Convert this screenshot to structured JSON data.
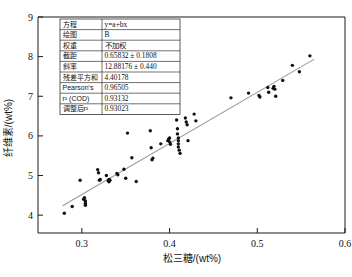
{
  "chart_data": {
    "type": "scatter",
    "title": "",
    "xlabel": "松三糖/(wt%)",
    "ylabel": "纤维素/(wt%)",
    "xlim": [
      0.25,
      0.6
    ],
    "ylim": [
      3.55,
      9.0
    ],
    "xticks": [
      "0.3",
      "0.4",
      "0.5",
      "0.6"
    ],
    "xtick_values": [
      0.3,
      0.4,
      0.5,
      0.6
    ],
    "yticks": [
      "4",
      "5",
      "6",
      "7",
      "8",
      "9"
    ],
    "ytick_values": [
      4,
      5,
      6,
      7,
      8,
      9
    ],
    "grid": false,
    "legend": "none",
    "series": [
      {
        "name": "B",
        "marker": "filled-circle",
        "color": "#111111",
        "points": [
          [
            0.28,
            4.05
          ],
          [
            0.289,
            4.22
          ],
          [
            0.298,
            4.88
          ],
          [
            0.302,
            4.4
          ],
          [
            0.303,
            4.44
          ],
          [
            0.304,
            4.3
          ],
          [
            0.304,
            4.36
          ],
          [
            0.304,
            4.25
          ],
          [
            0.318,
            5.15
          ],
          [
            0.319,
            5.07
          ],
          [
            0.32,
            4.88
          ],
          [
            0.321,
            4.9
          ],
          [
            0.328,
            5.0
          ],
          [
            0.33,
            4.87
          ],
          [
            0.331,
            4.9
          ],
          [
            0.331,
            4.84
          ],
          [
            0.332,
            4.88
          ],
          [
            0.34,
            5.05
          ],
          [
            0.341,
            5.02
          ],
          [
            0.348,
            5.16
          ],
          [
            0.35,
            4.93
          ],
          [
            0.352,
            6.07
          ],
          [
            0.357,
            5.45
          ],
          [
            0.362,
            4.85
          ],
          [
            0.378,
            6.13
          ],
          [
            0.379,
            5.7
          ],
          [
            0.38,
            5.4
          ],
          [
            0.381,
            5.44
          ],
          [
            0.39,
            5.8
          ],
          [
            0.398,
            5.88
          ],
          [
            0.399,
            5.92
          ],
          [
            0.4,
            5.85
          ],
          [
            0.4,
            5.95
          ],
          [
            0.401,
            5.79
          ],
          [
            0.408,
            6.4
          ],
          [
            0.409,
            6.18
          ],
          [
            0.409,
            6.05
          ],
          [
            0.41,
            5.95
          ],
          [
            0.41,
            5.88
          ],
          [
            0.41,
            5.8
          ],
          [
            0.41,
            5.72
          ],
          [
            0.411,
            5.64
          ],
          [
            0.412,
            5.56
          ],
          [
            0.418,
            6.45
          ],
          [
            0.419,
            6.35
          ],
          [
            0.42,
            6.28
          ],
          [
            0.421,
            5.88
          ],
          [
            0.428,
            6.55
          ],
          [
            0.43,
            6.38
          ],
          [
            0.47,
            6.96
          ],
          [
            0.49,
            7.08
          ],
          [
            0.502,
            7.02
          ],
          [
            0.503,
            6.98
          ],
          [
            0.512,
            7.22
          ],
          [
            0.513,
            7.1
          ],
          [
            0.518,
            7.2
          ],
          [
            0.519,
            7.25
          ],
          [
            0.52,
            7.18
          ],
          [
            0.521,
            7.0
          ],
          [
            0.529,
            7.4
          ],
          [
            0.54,
            7.78
          ],
          [
            0.548,
            7.62
          ],
          [
            0.56,
            8.02
          ]
        ]
      }
    ],
    "fit": {
      "type": "linear",
      "equation": "y=a+bx",
      "intercept": 0.65832,
      "slope": 12.88176,
      "x_start": 0.278,
      "x_end": 0.565,
      "color": "#9a9a9a"
    }
  },
  "stats_table": {
    "rows": [
      {
        "label": "方程",
        "value": "y=a+bx"
      },
      {
        "label": "绘图",
        "value": "B"
      },
      {
        "label": "权重",
        "value": "不加权"
      },
      {
        "label": "截距",
        "value": "0.65832 ± 0.1808"
      },
      {
        "label": "斜率",
        "value": "12.88176 ± 0.440"
      },
      {
        "label": "残差平方和",
        "value": "4.40178"
      },
      {
        "label": "Pearson's",
        "value": "0.96505"
      },
      {
        "label": "r² (COD)",
        "value": "0.93132"
      },
      {
        "label": "调整后r²",
        "value": "0.93023"
      }
    ]
  }
}
